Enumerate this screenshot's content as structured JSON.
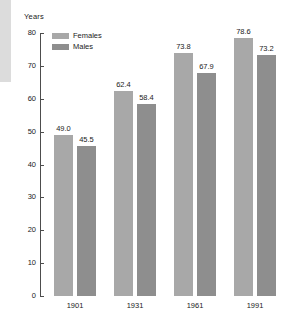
{
  "chart_data": {
    "type": "bar",
    "title": "",
    "xlabel": "",
    "ylabel": "Years",
    "categories": [
      "1901",
      "1931",
      "1961",
      "1991"
    ],
    "series": [
      {
        "name": "Females",
        "values": [
          49.0,
          62.4,
          73.8,
          78.6
        ],
        "color": "#a8a8a8"
      },
      {
        "name": "Males",
        "values": [
          45.5,
          58.4,
          67.9,
          73.2
        ],
        "color": "#8e8e8e"
      }
    ],
    "value_labels": {
      "females": [
        "49.0",
        "62.4",
        "73.8",
        "78.6"
      ],
      "males": [
        "45.5",
        "58.4",
        "67.9",
        "73.2"
      ]
    },
    "ylim": [
      0,
      80
    ],
    "ytick_labels": [
      "80",
      "70",
      "60",
      "50",
      "40",
      "30",
      "20",
      "10",
      "0"
    ],
    "ytick_values": [
      80,
      70,
      60,
      50,
      40,
      30,
      20,
      10,
      0
    ],
    "grid": false,
    "legend_position": "top-left"
  },
  "axis": {
    "unit_label": "Years"
  },
  "legend": {
    "entries": [
      {
        "label": "Females"
      },
      {
        "label": "Males"
      }
    ]
  }
}
